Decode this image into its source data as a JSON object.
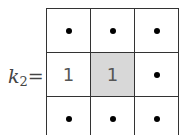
{
  "kernel": {
    "label_var": "k",
    "label_sub": "2",
    "label_eq": "=",
    "rows": [
      [
        {
          "type": "dot"
        },
        {
          "type": "dot"
        },
        {
          "type": "dot"
        }
      ],
      [
        {
          "type": "value",
          "value": "1"
        },
        {
          "type": "value",
          "value": "1",
          "highlight": true
        },
        {
          "type": "dot"
        }
      ],
      [
        {
          "type": "dot"
        },
        {
          "type": "dot"
        },
        {
          "type": "dot"
        }
      ]
    ],
    "highlight_color": "#d8d8d8"
  }
}
